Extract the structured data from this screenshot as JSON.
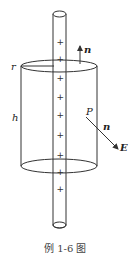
{
  "figure": {
    "caption": "例 1-6 图",
    "labels": {
      "radius": "r",
      "height": "h",
      "top_normal": "n",
      "point": "P",
      "side_normal": "n",
      "field": "E"
    },
    "charges": [
      "+",
      "+",
      "+",
      "+",
      "+",
      "+",
      "+",
      "+",
      "+"
    ],
    "colors": {
      "stroke": "#333333",
      "background": "#ffffff"
    }
  }
}
